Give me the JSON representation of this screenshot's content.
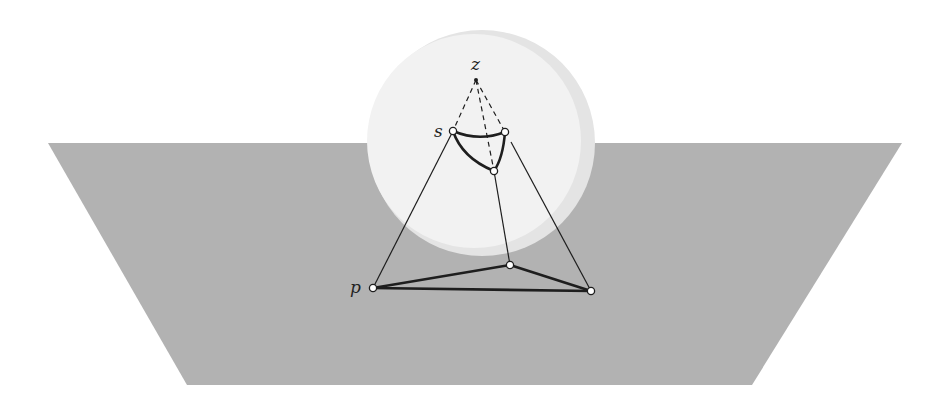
{
  "figure": {
    "colors": {
      "background": "#ffffff",
      "plane": "#b2b2b2",
      "sphere": "#f2f2f2",
      "sphere_shadow": "#e4e4e4",
      "stroke": "#1e1e1e",
      "vertex_fill": "#ffffff"
    },
    "plane": {
      "points": "48,143 902,143 752,385 187,385"
    },
    "sphere": {
      "cx": 480,
      "cy": 143,
      "r": 113
    },
    "points": {
      "z": {
        "x": 476,
        "y": 80,
        "label": "z"
      },
      "s": {
        "x": 453,
        "y": 131,
        "label": "s"
      },
      "s2": {
        "x": 505,
        "y": 132
      },
      "s3": {
        "x": 494,
        "y": 171
      },
      "p": {
        "x": 373,
        "y": 288,
        "label": "p"
      },
      "q": {
        "x": 510,
        "y": 265
      },
      "r": {
        "x": 591,
        "y": 291
      }
    },
    "labels": {
      "z": "z",
      "s": "s",
      "p": "p"
    }
  }
}
